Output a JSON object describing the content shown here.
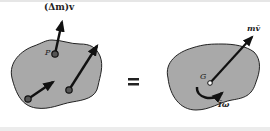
{
  "diagram": {
    "colors": {
      "body_fill": "#a9a9a9",
      "outline": "#222222",
      "arrow": "#111111",
      "background": "#ffffff"
    },
    "left_body": {
      "momentum_label": "(Δm)v",
      "point_label": "P",
      "particles": 3,
      "arrows": [
        "momentum-vector-at-P",
        "momentum-vector-right-particle",
        "momentum-vector-bottom-particle"
      ]
    },
    "equals_sign": "=",
    "right_body": {
      "center_label": "G",
      "linear_momentum_label": "mv̄",
      "angular_momentum_label": "Īω"
    }
  }
}
